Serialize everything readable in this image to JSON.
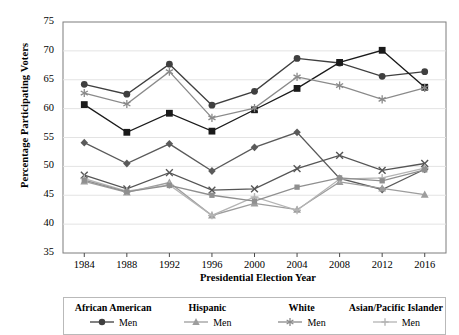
{
  "chart_data": {
    "type": "line",
    "title": "",
    "xlabel": "Presidential Election Year",
    "ylabel": "Percentage Participating Voters",
    "x": [
      1984,
      1988,
      1992,
      1996,
      2000,
      2004,
      2008,
      2012,
      2016
    ],
    "categories": [
      "1984",
      "1988",
      "1992",
      "1996",
      "2000",
      "2004",
      "2008",
      "2012",
      "2016"
    ],
    "xlim": [
      1982,
      2018
    ],
    "ylim": [
      35,
      75
    ],
    "yticks": [
      35,
      40,
      45,
      50,
      55,
      60,
      65,
      70,
      75
    ],
    "grid": "horizontal",
    "legend_position": "below",
    "series": [
      {
        "name": "African American Men",
        "group": "African American",
        "sex": "Men",
        "marker": "circle",
        "color": "#3f3f3f",
        "values": [
          64.2,
          62.5,
          67.7,
          60.6,
          63.0,
          68.7,
          67.9,
          65.6,
          66.4
        ]
      },
      {
        "name": "African American Women",
        "group": "African American",
        "sex": "Women",
        "marker": "square",
        "color": "#1a1a1a",
        "values": [
          60.7,
          55.9,
          59.2,
          56.1,
          59.8,
          63.5,
          68.0,
          70.1,
          63.7
        ]
      },
      {
        "name": "Hispanic Men",
        "group": "Hispanic",
        "sex": "Men",
        "marker": "diamond",
        "color": "#5a5a5a",
        "values": [
          54.1,
          50.5,
          53.9,
          49.2,
          53.3,
          55.9,
          47.9,
          46.0,
          49.5
        ]
      },
      {
        "name": "Hispanic Women",
        "group": "Hispanic",
        "sex": "Women",
        "marker": "triangle",
        "color": "#9d9d9d",
        "values": [
          47.4,
          45.5,
          47.2,
          41.5,
          43.6,
          42.5,
          47.3,
          46.2,
          45.1
        ]
      },
      {
        "name": "White Men",
        "group": "White",
        "sex": "Men",
        "marker": "asterisk",
        "color": "#8a8a8a",
        "values": [
          62.7,
          60.8,
          66.4,
          58.4,
          60.1,
          65.5,
          64.0,
          61.6,
          63.6
        ]
      },
      {
        "name": "White Women",
        "group": "White",
        "sex": "Women",
        "marker": "x",
        "color": "#555555",
        "values": [
          48.5,
          46.1,
          48.9,
          45.9,
          46.1,
          49.6,
          51.9,
          49.3,
          50.5
        ]
      },
      {
        "name": "Asian/Pacific Islander Men",
        "group": "Asian/Pacific Islander",
        "sex": "Men",
        "marker": "plus",
        "color": "#b4b4b4",
        "values": [
          47.9,
          45.7,
          46.8,
          41.5,
          44.7,
          42.4,
          47.8,
          48.0,
          49.7
        ]
      },
      {
        "name": "Asian/Pacific Islander Women",
        "group": "Asian/Pacific Islander",
        "sex": "Women",
        "marker": "smallsquare",
        "color": "#8f8f8f",
        "values": [
          47.6,
          45.6,
          46.7,
          45.0,
          44.0,
          46.4,
          48.0,
          47.5,
          49.4
        ]
      }
    ]
  },
  "legend": {
    "columns": [
      {
        "header": "African American",
        "entry": "Men",
        "marker": "circle",
        "color": "#3f3f3f"
      },
      {
        "header": "Hispanic",
        "entry": "Men",
        "marker": "triangle",
        "color": "#9d9d9d"
      },
      {
        "header": "White",
        "entry": "Men",
        "marker": "asterisk",
        "color": "#8a8a8a"
      },
      {
        "header": "Asian/Pacific Islander",
        "entry": "Men",
        "marker": "plus",
        "color": "#b4b4b4"
      }
    ]
  }
}
